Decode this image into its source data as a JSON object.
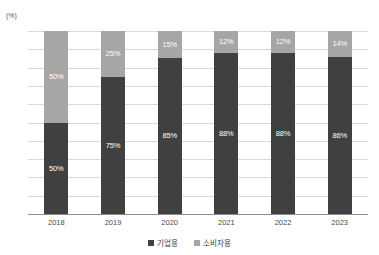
{
  "chart_data": {
    "type": "bar",
    "subtype": "stacked-percentage-column",
    "title": "",
    "subtitle": "",
    "xlabel": "",
    "ylabel": "(%)",
    "unit": "(%)",
    "categories": [
      "2018",
      "2019",
      "2020",
      "2021",
      "2022",
      "2023"
    ],
    "series": [
      {
        "name": "기업용",
        "color": "#404040",
        "values": [
          50,
          75,
          85,
          88,
          88,
          86
        ],
        "labels": [
          "50%",
          "75%",
          "85%",
          "88%",
          "88%",
          "86%"
        ]
      },
      {
        "name": "소비자용",
        "color": "#a6a6a6",
        "values": [
          50,
          25,
          15,
          12,
          12,
          14
        ],
        "labels": [
          "50%",
          "25%",
          "15%",
          "12%",
          "12%",
          "14%"
        ]
      }
    ],
    "ylim": [
      0,
      100
    ],
    "yticks": [
      0,
      10,
      20,
      30,
      40,
      50,
      60,
      70,
      80,
      90,
      100
    ],
    "ytick_labels": [
      "0",
      "10",
      "20",
      "30",
      "40",
      "50",
      "60",
      "70",
      "80",
      "90",
      "100"
    ],
    "grid": true,
    "grid_axis": "y",
    "legend_position": "bottom",
    "legend": [
      "기업용",
      "소비자용"
    ],
    "colors": {
      "series_business": "#404040",
      "series_consumer": "#a6a6a6",
      "gridline": "#d9d9d9",
      "axis": "#8c8c8c",
      "background": "#ffffff",
      "tick_text": "#4a4a4a",
      "data_label_text": "#ffffff"
    }
  }
}
